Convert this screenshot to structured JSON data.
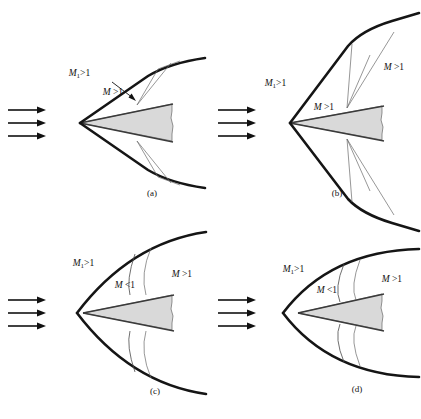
{
  "figure": {
    "title": "",
    "background_color": "#ffffff",
    "width": 421,
    "height": 419,
    "body_fill_color": "#d9d9d9",
    "shock_color": "#111111",
    "mach_line_color": "#555555",
    "arrow_color": "#111111"
  },
  "panels": [
    {
      "id": "a",
      "caption": "(a)",
      "description": "attached oblique shock on slender wedge, supersonic flow behind shock",
      "labels": [
        {
          "name": "freestream-mach-label",
          "text": "M₁>1"
        },
        {
          "name": "post-shock-mach-label",
          "text": "M>1"
        }
      ],
      "has_leader_arrow": true,
      "inflow_arrows": 3
    },
    {
      "id": "b",
      "caption": "(b)",
      "description": "attached oblique shock on blunter wedge with curved shock and expansion fan, supersonic behind shock",
      "labels": [
        {
          "name": "freestream-mach-label",
          "text": "M₁>1"
        },
        {
          "name": "post-shock-mach-label-inner",
          "text": "M>1"
        },
        {
          "name": "post-shock-mach-label-outer",
          "text": "M>1"
        }
      ],
      "has_leader_arrow": false,
      "inflow_arrows": 3
    },
    {
      "id": "c",
      "caption": "(c)",
      "description": "detached bow shock ahead of wedge, subsonic pocket behind normal portion then supersonic",
      "labels": [
        {
          "name": "freestream-mach-label",
          "text": "M₁>1"
        },
        {
          "name": "subsonic-region-label",
          "text": "M<1"
        },
        {
          "name": "supersonic-region-label",
          "text": "M>1"
        }
      ],
      "has_leader_arrow": false,
      "inflow_arrows": 3
    },
    {
      "id": "d",
      "caption": "(d)",
      "description": "detached bow shock further upstream of blunter wedge, subsonic pocket then supersonic",
      "labels": [
        {
          "name": "freestream-mach-label",
          "text": "M₁>1"
        },
        {
          "name": "subsonic-region-label",
          "text": "M<1"
        },
        {
          "name": "supersonic-region-label",
          "text": "M>1"
        }
      ],
      "has_leader_arrow": false,
      "inflow_arrows": 3
    }
  ],
  "symbols": {
    "mach_italic": "M",
    "subscript_one": "1",
    "greater_than": ">",
    "less_than": "<",
    "one": "1"
  }
}
